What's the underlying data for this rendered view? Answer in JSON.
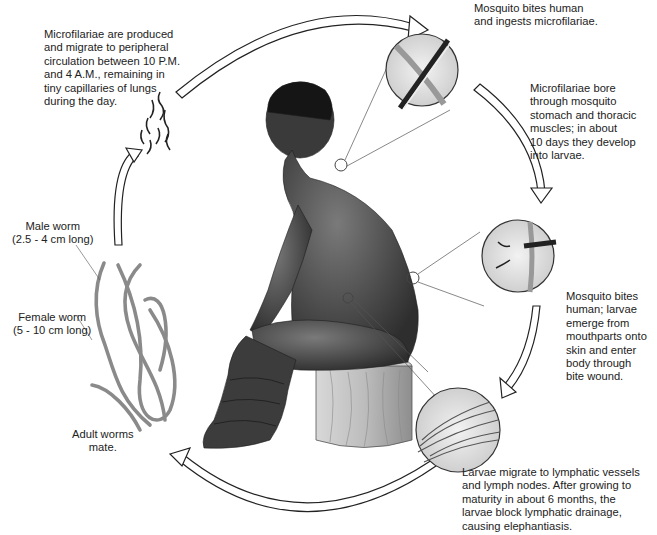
{
  "diagram": {
    "type": "life-cycle",
    "stages": [
      {
        "id": "microfilariae",
        "text": "Microfilariae are produced\nand migrate to peripheral\ncirculation between 10 P.M.\nand 4 A.M., remaining in\ntiny capillaries of lungs\nduring the day."
      },
      {
        "id": "mosquito-ingests",
        "text": "Mosquito bites human\nand ingests microfilariae."
      },
      {
        "id": "bore-through",
        "text": "Microfilariae bore\nthrough mosquito\nstomach and thoracic\nmuscles; in about\n10 days they develop\ninto larvae."
      },
      {
        "id": "mosquito-transmits",
        "text": "Mosquito bites\nhuman; larvae\nemerge from\nmouthparts onto\nskin and enter\nbody through\nbite wound."
      },
      {
        "id": "lymphatic",
        "text": "Larvae migrate to lymphatic vessels\nand lymph nodes. After growing to\nmaturity in about 6 months, the\nlarvae block lymphatic drainage,\ncausing elephantiasis."
      },
      {
        "id": "adults-mate",
        "text": "Adult worms\nmate."
      }
    ],
    "worm_labels": {
      "male": "Male worm\n(2.5 - 4 cm long)",
      "female": "Female worm\n(5 - 10 cm long)"
    },
    "colors": {
      "background": "#ffffff",
      "skin": "#4a4a4a",
      "stool": "#b8b8b8",
      "worm": "#9a9a9a",
      "outline": "#333333"
    }
  }
}
